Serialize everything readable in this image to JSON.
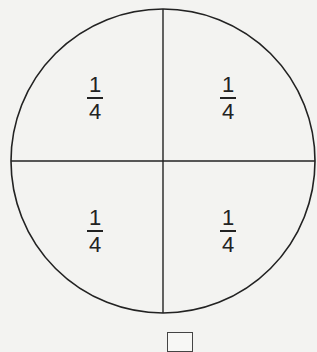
{
  "diagram": {
    "shape": "circle",
    "divisions": 4,
    "colors": {
      "stroke": "#222222",
      "background": "#f3f3f1"
    },
    "sections": [
      {
        "position": "top-left",
        "numerator": "1",
        "denominator": "4"
      },
      {
        "position": "top-right",
        "numerator": "1",
        "denominator": "4"
      },
      {
        "position": "bottom-left",
        "numerator": "1",
        "denominator": "4"
      },
      {
        "position": "bottom-right",
        "numerator": "1",
        "denominator": "4"
      }
    ]
  },
  "answer_box": {
    "value": ""
  }
}
